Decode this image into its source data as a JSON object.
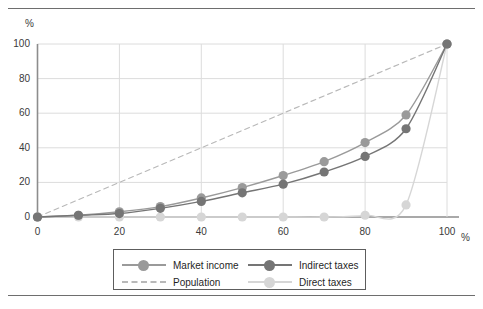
{
  "chart_data": {
    "type": "line",
    "title": "",
    "subtitle": "",
    "xlabel": "%",
    "ylabel": "%",
    "xlim": [
      0,
      100
    ],
    "ylim": [
      0,
      100
    ],
    "x": [
      0,
      10,
      20,
      30,
      40,
      50,
      60,
      70,
      80,
      90,
      100
    ],
    "xticks": [
      "0",
      "20",
      "40",
      "60",
      "80",
      "100"
    ],
    "xtick_values": [
      0,
      20,
      40,
      60,
      80,
      100
    ],
    "yticks": [
      "0",
      "20",
      "40",
      "60",
      "80",
      "100"
    ],
    "ytick_values": [
      0,
      20,
      40,
      60,
      80,
      100
    ],
    "grid": "both",
    "legend_position": "bottom",
    "series": [
      {
        "name": "Market income",
        "color": "#9a9a9a",
        "style": "solid",
        "markers": true,
        "values": [
          0,
          1,
          3,
          6,
          11,
          17,
          24,
          32,
          43,
          59,
          100
        ]
      },
      {
        "name": "Indirect taxes",
        "color": "#757575",
        "style": "solid",
        "markers": true,
        "values": [
          0,
          1,
          2,
          5,
          9,
          14,
          19,
          26,
          35,
          51,
          100
        ]
      },
      {
        "name": "Population",
        "color": "#b9b9b9",
        "style": "dashed",
        "markers": false,
        "values": [
          0,
          10,
          20,
          30,
          40,
          50,
          60,
          70,
          80,
          90,
          100
        ]
      },
      {
        "name": "Direct taxes",
        "color": "#d6d6d6",
        "style": "solid",
        "markers": true,
        "values": [
          0,
          0,
          0,
          0,
          0,
          0,
          0,
          0,
          1,
          7,
          100
        ]
      }
    ]
  },
  "axes": {
    "y_unit": "%",
    "x_unit": "%"
  },
  "legend": {
    "entries": [
      {
        "label": "Market income",
        "color": "#9a9a9a",
        "style": "solid",
        "marker": true
      },
      {
        "label": "Indirect taxes",
        "color": "#757575",
        "style": "solid",
        "marker": true
      },
      {
        "label": "Population",
        "color": "#b9b9b9",
        "style": "dashed",
        "marker": false
      },
      {
        "label": "Direct taxes",
        "color": "#d6d6d6",
        "style": "solid",
        "marker": true
      }
    ]
  },
  "colors": {
    "frame_rule": "#6e6e6e",
    "axis": "#8d8d8d",
    "grid": "#dcdcdc",
    "legend_border": "#5d5d5d",
    "text": "#3a3a3a",
    "background": "#ffffff"
  }
}
